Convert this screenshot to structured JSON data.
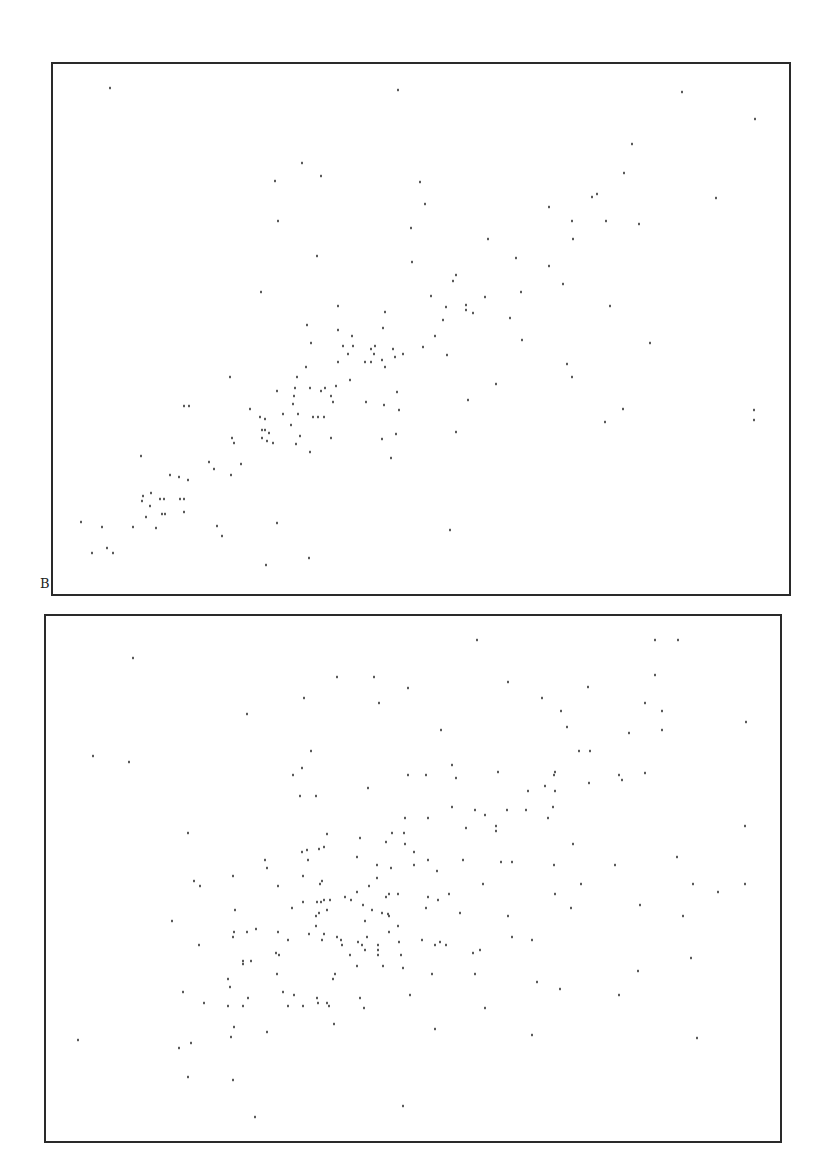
{
  "chart_data": [
    {
      "type": "scatter",
      "panel_label": "B",
      "title": "",
      "xlabel": "",
      "ylabel": "",
      "grid": false,
      "legend": null,
      "frame": {
        "left": 52,
        "top": 63,
        "right": 790,
        "bottom": 595
      },
      "frame_color": "#2a2a2a",
      "point_color": "#333333",
      "units": "pixel coordinates (no axis ticks or tick labels shown)",
      "points": [
        [
          110,
          88
        ],
        [
          398,
          90
        ],
        [
          302,
          163
        ],
        [
          275,
          181
        ],
        [
          321,
          176
        ],
        [
          420,
          182
        ],
        [
          278,
          221
        ],
        [
          411,
          228
        ],
        [
          317,
          256
        ],
        [
          412,
          262
        ],
        [
          261,
          292
        ],
        [
          338,
          306
        ],
        [
          385,
          312
        ],
        [
          307,
          325
        ],
        [
          338,
          330
        ],
        [
          383,
          328
        ],
        [
          682,
          92
        ],
        [
          755,
          119
        ],
        [
          632,
          144
        ],
        [
          624,
          173
        ],
        [
          592,
          197
        ],
        [
          597,
          194
        ],
        [
          716,
          198
        ],
        [
          425,
          204
        ],
        [
          549,
          207
        ],
        [
          572,
          221
        ],
        [
          606,
          221
        ],
        [
          639,
          224
        ],
        [
          488,
          239
        ],
        [
          573,
          239
        ],
        [
          516,
          258
        ],
        [
          549,
          266
        ],
        [
          456,
          275
        ],
        [
          453,
          281
        ],
        [
          563,
          284
        ],
        [
          521,
          292
        ],
        [
          431,
          296
        ],
        [
          485,
          297
        ],
        [
          446,
          307
        ],
        [
          466,
          305
        ],
        [
          466,
          310
        ],
        [
          473,
          313
        ],
        [
          610,
          306
        ],
        [
          510,
          318
        ],
        [
          443,
          320
        ],
        [
          352,
          336
        ],
        [
          311,
          343
        ],
        [
          343,
          346
        ],
        [
          353,
          346
        ],
        [
          371,
          349
        ],
        [
          375,
          346
        ],
        [
          393,
          349
        ],
        [
          348,
          354
        ],
        [
          374,
          354
        ],
        [
          395,
          357
        ],
        [
          403,
          354
        ],
        [
          382,
          360
        ],
        [
          338,
          362
        ],
        [
          365,
          362
        ],
        [
          371,
          362
        ],
        [
          306,
          367
        ],
        [
          385,
          367
        ],
        [
          297,
          377
        ],
        [
          350,
          380
        ],
        [
          230,
          377
        ],
        [
          336,
          386
        ],
        [
          277,
          391
        ],
        [
          295,
          388
        ],
        [
          310,
          388
        ],
        [
          321,
          391
        ],
        [
          325,
          388
        ],
        [
          397,
          392
        ],
        [
          294,
          396
        ],
        [
          331,
          396
        ],
        [
          333,
          402
        ],
        [
          293,
          404
        ],
        [
          366,
          402
        ],
        [
          384,
          405
        ],
        [
          399,
          410
        ],
        [
          184,
          406
        ],
        [
          189,
          406
        ],
        [
          250,
          409
        ],
        [
          283,
          414
        ],
        [
          298,
          414
        ],
        [
          260,
          417
        ],
        [
          265,
          419
        ],
        [
          313,
          417
        ],
        [
          318,
          417
        ],
        [
          324,
          417
        ],
        [
          291,
          425
        ],
        [
          262,
          430
        ],
        [
          265,
          430
        ],
        [
          269,
          433
        ],
        [
          300,
          436
        ],
        [
          396,
          434
        ],
        [
          232,
          438
        ],
        [
          262,
          438
        ],
        [
          331,
          438
        ],
        [
          382,
          439
        ],
        [
          234,
          443
        ],
        [
          267,
          441
        ],
        [
          273,
          443
        ],
        [
          296,
          444
        ],
        [
          310,
          452
        ],
        [
          141,
          456
        ],
        [
          391,
          458
        ],
        [
          209,
          462
        ],
        [
          241,
          464
        ],
        [
          214,
          469
        ],
        [
          170,
          475
        ],
        [
          179,
          477
        ],
        [
          231,
          475
        ],
        [
          188,
          480
        ],
        [
          143,
          496
        ],
        [
          151,
          493
        ],
        [
          142,
          501
        ],
        [
          160,
          499
        ],
        [
          164,
          499
        ],
        [
          180,
          499
        ],
        [
          184,
          499
        ],
        [
          150,
          506
        ],
        [
          184,
          512
        ],
        [
          146,
          517
        ],
        [
          162,
          514
        ],
        [
          165,
          514
        ],
        [
          81,
          522
        ],
        [
          277,
          523
        ],
        [
          102,
          527
        ],
        [
          133,
          527
        ],
        [
          156,
          528
        ],
        [
          217,
          526
        ],
        [
          222,
          536
        ],
        [
          107,
          548
        ],
        [
          92,
          553
        ],
        [
          113,
          553
        ],
        [
          309,
          558
        ],
        [
          266,
          565
        ],
        [
          435,
          336
        ],
        [
          423,
          347
        ],
        [
          522,
          340
        ],
        [
          650,
          343
        ],
        [
          447,
          355
        ],
        [
          567,
          364
        ],
        [
          572,
          377
        ],
        [
          496,
          384
        ],
        [
          468,
          400
        ],
        [
          754,
          410
        ],
        [
          623,
          409
        ],
        [
          754,
          420
        ],
        [
          605,
          422
        ],
        [
          456,
          432
        ],
        [
          450,
          530
        ]
      ]
    },
    {
      "type": "scatter",
      "panel_label": "",
      "title": "",
      "xlabel": "",
      "ylabel": "",
      "grid": false,
      "legend": null,
      "frame": {
        "left": 45,
        "top": 615,
        "right": 781,
        "bottom": 1142
      },
      "frame_color": "#2a2a2a",
      "point_color": "#333333",
      "units": "pixel coordinates (no axis ticks or tick labels shown)",
      "points": [
        [
          133,
          658
        ],
        [
          337,
          677
        ],
        [
          374,
          677
        ],
        [
          408,
          688
        ],
        [
          304,
          698
        ],
        [
          379,
          703
        ],
        [
          247,
          714
        ],
        [
          93,
          756
        ],
        [
          129,
          762
        ],
        [
          311,
          751
        ],
        [
          302,
          768
        ],
        [
          293,
          775
        ],
        [
          408,
          775
        ],
        [
          368,
          788
        ],
        [
          300,
          796
        ],
        [
          316,
          796
        ],
        [
          405,
          818
        ],
        [
          188,
          833
        ],
        [
          327,
          834
        ],
        [
          360,
          838
        ],
        [
          392,
          833
        ],
        [
          404,
          833
        ],
        [
          386,
          842
        ],
        [
          405,
          844
        ],
        [
          302,
          852
        ],
        [
          307,
          850
        ],
        [
          319,
          849
        ],
        [
          324,
          847
        ],
        [
          414,
          852
        ],
        [
          357,
          857
        ],
        [
          265,
          860
        ],
        [
          308,
          860
        ],
        [
          377,
          865
        ],
        [
          391,
          868
        ],
        [
          414,
          865
        ],
        [
          267,
          868
        ],
        [
          233,
          876
        ],
        [
          303,
          876
        ],
        [
          377,
          878
        ],
        [
          477,
          640
        ],
        [
          655,
          640
        ],
        [
          678,
          640
        ],
        [
          655,
          675
        ],
        [
          508,
          682
        ],
        [
          588,
          687
        ],
        [
          542,
          698
        ],
        [
          645,
          703
        ],
        [
          561,
          711
        ],
        [
          662,
          711
        ],
        [
          746,
          722
        ],
        [
          567,
          727
        ],
        [
          441,
          730
        ],
        [
          629,
          733
        ],
        [
          662,
          730
        ],
        [
          579,
          751
        ],
        [
          590,
          751
        ],
        [
          452,
          765
        ],
        [
          426,
          775
        ],
        [
          498,
          772
        ],
        [
          555,
          772
        ],
        [
          554,
          775
        ],
        [
          456,
          778
        ],
        [
          619,
          775
        ],
        [
          622,
          780
        ],
        [
          645,
          773
        ],
        [
          589,
          783
        ],
        [
          545,
          786
        ],
        [
          528,
          791
        ],
        [
          555,
          791
        ],
        [
          452,
          807
        ],
        [
          475,
          810
        ],
        [
          507,
          810
        ],
        [
          526,
          810
        ],
        [
          553,
          807
        ],
        [
          485,
          815
        ],
        [
          428,
          818
        ],
        [
          548,
          818
        ],
        [
          466,
          828
        ],
        [
          496,
          826
        ],
        [
          496,
          831
        ],
        [
          745,
          826
        ],
        [
          573,
          844
        ],
        [
          428,
          860
        ],
        [
          463,
          860
        ],
        [
          501,
          862
        ],
        [
          512,
          862
        ],
        [
          554,
          865
        ],
        [
          615,
          865
        ],
        [
          677,
          857
        ],
        [
          437,
          871
        ],
        [
          194,
          881
        ],
        [
          200,
          886
        ],
        [
          278,
          886
        ],
        [
          320,
          884
        ],
        [
          322,
          881
        ],
        [
          357,
          892
        ],
        [
          369,
          886
        ],
        [
          386,
          897
        ],
        [
          389,
          894
        ],
        [
          398,
          894
        ],
        [
          303,
          902
        ],
        [
          317,
          902
        ],
        [
          321,
          902
        ],
        [
          324,
          900
        ],
        [
          330,
          900
        ],
        [
          345,
          897
        ],
        [
          351,
          900
        ],
        [
          292,
          908
        ],
        [
          235,
          910
        ],
        [
          327,
          910
        ],
        [
          363,
          905
        ],
        [
          372,
          910
        ],
        [
          382,
          913
        ],
        [
          388,
          914
        ],
        [
          389,
          916
        ],
        [
          316,
          916
        ],
        [
          319,
          913
        ],
        [
          172,
          921
        ],
        [
          365,
          921
        ],
        [
          316,
          926
        ],
        [
          398,
          926
        ],
        [
          234,
          932
        ],
        [
          247,
          932
        ],
        [
          256,
          929
        ],
        [
          278,
          932
        ],
        [
          309,
          934
        ],
        [
          324,
          934
        ],
        [
          389,
          932
        ],
        [
          233,
          937
        ],
        [
          288,
          940
        ],
        [
          322,
          940
        ],
        [
          337,
          937
        ],
        [
          341,
          940
        ],
        [
          342,
          945
        ],
        [
          358,
          942
        ],
        [
          362,
          945
        ],
        [
          367,
          937
        ],
        [
          378,
          945
        ],
        [
          399,
          942
        ],
        [
          199,
          945
        ],
        [
          365,
          950
        ],
        [
          378,
          950
        ],
        [
          276,
          953
        ],
        [
          279,
          955
        ],
        [
          350,
          955
        ],
        [
          378,
          955
        ],
        [
          401,
          955
        ],
        [
          243,
          961
        ],
        [
          243,
          964
        ],
        [
          251,
          961
        ],
        [
          357,
          966
        ],
        [
          383,
          966
        ],
        [
          403,
          968
        ],
        [
          277,
          974
        ],
        [
          335,
          974
        ],
        [
          333,
          979
        ],
        [
          228,
          979
        ],
        [
          230,
          987
        ],
        [
          183,
          992
        ],
        [
          283,
          992
        ],
        [
          294,
          995
        ],
        [
          410,
          995
        ],
        [
          248,
          998
        ],
        [
          317,
          998
        ],
        [
          360,
          998
        ],
        [
          204,
          1003
        ],
        [
          228,
          1006
        ],
        [
          243,
          1006
        ],
        [
          288,
          1006
        ],
        [
          303,
          1006
        ],
        [
          318,
          1003
        ],
        [
          327,
          1003
        ],
        [
          329,
          1006
        ],
        [
          364,
          1008
        ],
        [
          334,
          1024
        ],
        [
          234,
          1027
        ],
        [
          267,
          1032
        ],
        [
          231,
          1037
        ],
        [
          78,
          1040
        ],
        [
          191,
          1043
        ],
        [
          179,
          1048
        ],
        [
          188,
          1077
        ],
        [
          233,
          1080
        ],
        [
          403,
          1106
        ],
        [
          255,
          1117
        ],
        [
          483,
          884
        ],
        [
          581,
          884
        ],
        [
          693,
          884
        ],
        [
          745,
          884
        ],
        [
          718,
          892
        ],
        [
          428,
          897
        ],
        [
          438,
          900
        ],
        [
          449,
          894
        ],
        [
          555,
          894
        ],
        [
          426,
          908
        ],
        [
          460,
          913
        ],
        [
          571,
          908
        ],
        [
          640,
          905
        ],
        [
          508,
          916
        ],
        [
          683,
          916
        ],
        [
          422,
          940
        ],
        [
          512,
          937
        ],
        [
          532,
          940
        ],
        [
          435,
          945
        ],
        [
          440,
          942
        ],
        [
          446,
          945
        ],
        [
          473,
          953
        ],
        [
          480,
          950
        ],
        [
          691,
          958
        ],
        [
          432,
          974
        ],
        [
          475,
          974
        ],
        [
          638,
          971
        ],
        [
          537,
          982
        ],
        [
          560,
          989
        ],
        [
          619,
          995
        ],
        [
          485,
          1008
        ],
        [
          435,
          1029
        ],
        [
          532,
          1035
        ],
        [
          697,
          1038
        ]
      ]
    }
  ]
}
